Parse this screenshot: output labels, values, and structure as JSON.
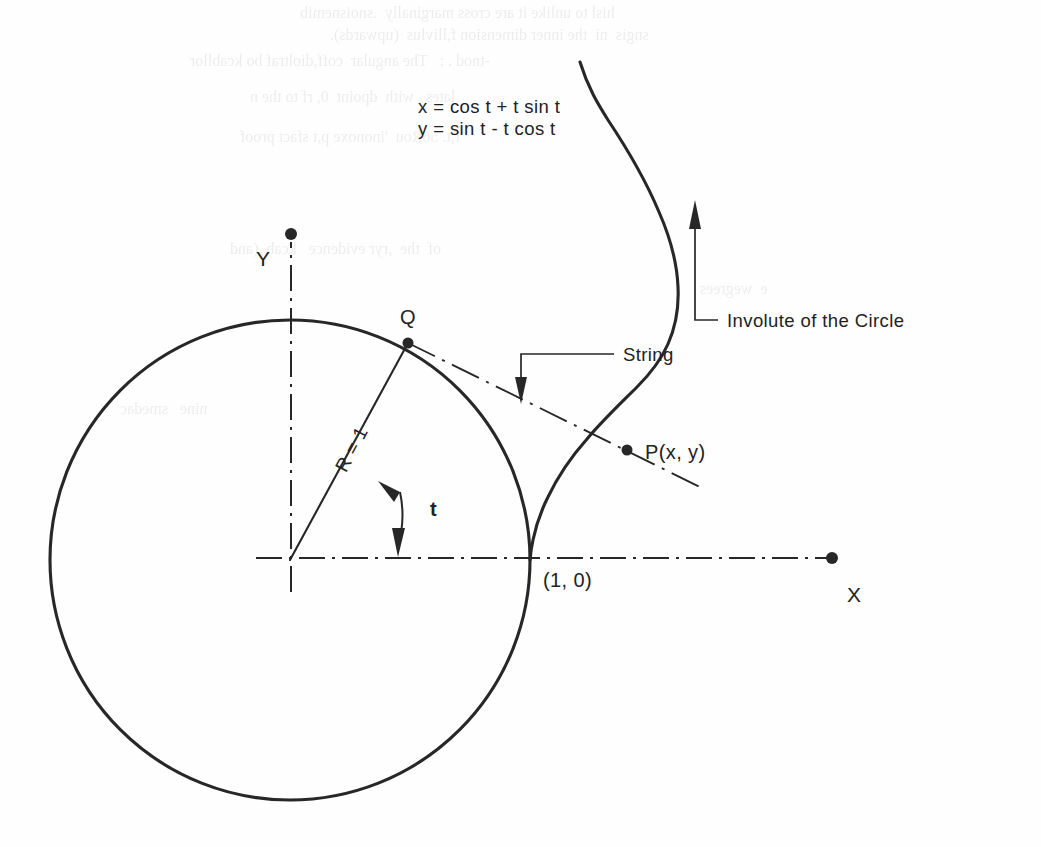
{
  "figure": {
    "title": "Involute of the Circle",
    "type": "geometric-diagram",
    "parametric_equations": {
      "x": "x = cos t + t sin t",
      "y": "y = sin t - t cos t"
    },
    "labels": {
      "axis_x": "X",
      "axis_y": "Y",
      "point_q": "Q",
      "point_p": "P(x, y)",
      "point_one_zero": "(1, 0)",
      "radius": "R = 1",
      "angle": "t",
      "string": "String",
      "curve": "Involute of the Circle"
    },
    "geometry": {
      "origin_px": [
        290,
        560
      ],
      "circle_radius_px": 240,
      "circle_radius_units": 1,
      "angle_t_degrees": 62,
      "q_point_px": [
        408,
        343
      ],
      "p_point_px": [
        627,
        450
      ],
      "tangent_point_px": [
        538,
        558
      ],
      "x_axis_end_px": [
        832,
        558
      ],
      "y_axis_end_px": [
        291,
        234
      ],
      "involute_end_px": [
        580,
        60
      ]
    },
    "colors": {
      "ink": "#272727",
      "paper": "#fefefe"
    }
  },
  "bleed_through": {
    "lines": [
      "hisl to unlike it are cross marginally  .snoisnemib",
      "sngis  ni  the inner dimension f,llivlus  (upwards).",
      "-tnod . :   The angular  coff,dioltraf bo kcabllor",
      "lates   with  dpoint  0, rf to the n",
      "f,t. 56Rou  'inonoxe p,t sfact proof",
      "of  the  ,ryr evidence   kcab ,(and",
      "e  wegrees",
      "nine   smedac"
    ]
  }
}
